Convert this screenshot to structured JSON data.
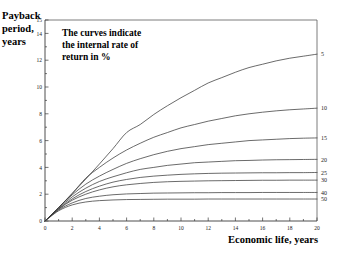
{
  "chart_data": {
    "type": "line",
    "title": "",
    "xlabel": "Economic life, years",
    "ylabel": "Payback period, years",
    "annotation": "The curves indicate the internal rate of return in %",
    "annotation_lines": [
      "The curves indicate",
      "the internal rate of",
      "return in %"
    ],
    "xlim": [
      0,
      20
    ],
    "ylim": [
      0,
      15
    ],
    "xticks": [
      0,
      2,
      4,
      6,
      8,
      10,
      12,
      14,
      16,
      18,
      20
    ],
    "xticklabels": [
      "0",
      "2",
      "4",
      "6",
      "8",
      "10",
      "12",
      "14",
      "16",
      "18",
      "20"
    ],
    "yticks": [
      0,
      2,
      4,
      6,
      8,
      10,
      12,
      14,
      15
    ],
    "yticklabels": [
      "0",
      "2",
      "4",
      "6",
      "8",
      "10",
      "12",
      "14",
      "15"
    ],
    "y_minor_ticks": [
      1,
      3,
      5,
      7,
      9,
      11,
      13
    ],
    "grid": false,
    "legend_position": "right-inline-labels",
    "x": [
      0,
      1,
      2,
      3,
      4,
      5,
      6,
      7,
      8,
      9,
      10,
      11,
      12,
      13,
      14,
      15,
      16,
      17,
      18,
      19,
      20
    ],
    "series": [
      {
        "name": "5",
        "label": "5",
        "rate_percent": 5,
        "values": [
          0,
          1.0,
          2.05,
          3.13,
          4.25,
          5.4,
          6.6,
          7.2,
          7.95,
          8.6,
          9.2,
          9.75,
          10.3,
          10.7,
          11.1,
          11.45,
          11.7,
          11.95,
          12.15,
          12.3,
          12.45
        ]
      },
      {
        "name": "10",
        "label": "10",
        "rate_percent": 10,
        "values": [
          0,
          1.0,
          2.05,
          3.2,
          4.0,
          4.7,
          5.3,
          5.8,
          6.25,
          6.6,
          6.95,
          7.2,
          7.45,
          7.65,
          7.85,
          8.0,
          8.12,
          8.22,
          8.3,
          8.36,
          8.42
        ]
      },
      {
        "name": "15",
        "label": "15",
        "rate_percent": 15,
        "values": [
          0,
          1.0,
          1.95,
          2.75,
          3.35,
          3.85,
          4.3,
          4.65,
          4.95,
          5.2,
          5.4,
          5.55,
          5.7,
          5.8,
          5.9,
          6.0,
          6.05,
          6.1,
          6.15,
          6.18,
          6.2
        ]
      },
      {
        "name": "20",
        "label": "20",
        "rate_percent": 20,
        "values": [
          0,
          0.95,
          1.8,
          2.45,
          2.95,
          3.3,
          3.6,
          3.85,
          4.0,
          4.15,
          4.25,
          4.35,
          4.4,
          4.45,
          4.5,
          4.52,
          4.55,
          4.57,
          4.58,
          4.59,
          4.6
        ]
      },
      {
        "name": "25",
        "label": "25",
        "rate_percent": 25,
        "values": [
          0,
          0.9,
          1.65,
          2.2,
          2.6,
          2.9,
          3.1,
          3.25,
          3.35,
          3.42,
          3.48,
          3.52,
          3.55,
          3.57,
          3.58,
          3.59,
          3.6,
          3.6,
          3.61,
          3.61,
          3.62
        ]
      },
      {
        "name": "30",
        "label": "30",
        "rate_percent": 30,
        "values": [
          0,
          0.88,
          1.55,
          2.0,
          2.32,
          2.55,
          2.7,
          2.8,
          2.88,
          2.93,
          2.96,
          2.98,
          3.0,
          3.01,
          3.02,
          3.03,
          3.04,
          3.04,
          3.05,
          3.05,
          3.05
        ]
      },
      {
        "name": "40",
        "label": "40",
        "rate_percent": 40,
        "values": [
          0,
          0.82,
          1.35,
          1.68,
          1.85,
          1.96,
          2.02,
          2.05,
          2.08,
          2.09,
          2.1,
          2.11,
          2.11,
          2.12,
          2.12,
          2.12,
          2.13,
          2.13,
          2.13,
          2.13,
          2.13
        ]
      },
      {
        "name": "50",
        "label": "50",
        "rate_percent": 50,
        "values": [
          0,
          0.76,
          1.2,
          1.42,
          1.52,
          1.57,
          1.6,
          1.61,
          1.62,
          1.63,
          1.63,
          1.63,
          1.64,
          1.64,
          1.64,
          1.64,
          1.64,
          1.64,
          1.64,
          1.64,
          1.64
        ]
      }
    ]
  },
  "axes": {
    "y_title_lines": [
      "Payback",
      "period,",
      "years"
    ],
    "x_title": "Economic life, years"
  },
  "colors": {
    "background": "#ffffff",
    "axis": "#3a3a3a",
    "curve": "#3a3a3a",
    "text": "#111111"
  }
}
